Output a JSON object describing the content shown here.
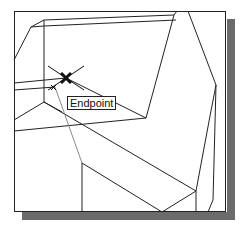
{
  "snap": {
    "tooltip_label": "Endpoint",
    "marker_position": [
      66,
      78
    ]
  },
  "colors": {
    "line": "#222222",
    "construction_line": "#8a8a8a",
    "shadow": "#6b6b6b",
    "background": "#ffffff"
  }
}
